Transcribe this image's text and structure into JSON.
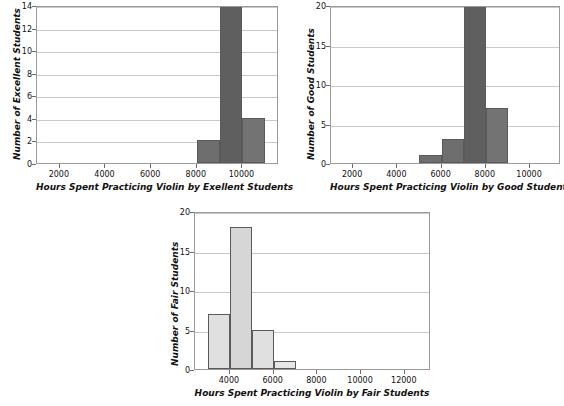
{
  "chart_data": [
    {
      "type": "bar",
      "id": "excellent",
      "title": "",
      "xlabel": "Hours Spent Practicing Violin by Exellent Students",
      "ylabel": "Number of Excellent Students",
      "xticks": [
        2000,
        4000,
        6000,
        8000,
        10000
      ],
      "yticks": [
        0,
        2,
        4,
        6,
        8,
        10,
        12,
        14
      ],
      "xlim": [
        1000,
        11600
      ],
      "ylim": [
        0,
        14
      ],
      "grid": true,
      "bin_width": 1000,
      "bars": [
        {
          "bin_start": 8000,
          "bin_end": 9000,
          "value": 2,
          "color": "#6e6e6e"
        },
        {
          "bin_start": 9000,
          "bin_end": 10000,
          "value": 14,
          "color": "#5f5f5f"
        },
        {
          "bin_start": 10000,
          "bin_end": 11000,
          "value": 4,
          "color": "#737373"
        }
      ]
    },
    {
      "type": "bar",
      "id": "good",
      "title": "",
      "xlabel": "Hours Spent Practicing Violin by Good Students",
      "ylabel": "Number of Good Students",
      "xticks": [
        2000,
        4000,
        6000,
        8000,
        10000
      ],
      "yticks": [
        0,
        5,
        10,
        15,
        20
      ],
      "xlim": [
        1000,
        11400
      ],
      "ylim": [
        0,
        20
      ],
      "grid": true,
      "bin_width": 1000,
      "bars": [
        {
          "bin_start": 5000,
          "bin_end": 6000,
          "value": 1,
          "color": "#6e6e6e"
        },
        {
          "bin_start": 6000,
          "bin_end": 7000,
          "value": 3,
          "color": "#6e6e6e"
        },
        {
          "bin_start": 7000,
          "bin_end": 8000,
          "value": 20,
          "color": "#5f5f5f"
        },
        {
          "bin_start": 8000,
          "bin_end": 9000,
          "value": 7,
          "color": "#737373"
        }
      ]
    },
    {
      "type": "bar",
      "id": "fair",
      "title": "",
      "xlabel": "Hours Spent Practicing Violin by Fair Students",
      "ylabel": "Number of Fair Students",
      "xticks": [
        4000,
        6000,
        8000,
        10000,
        12000
      ],
      "yticks": [
        0,
        5,
        10,
        15,
        20
      ],
      "xlim": [
        2400,
        13200
      ],
      "ylim": [
        0,
        20
      ],
      "grid": true,
      "bin_width": 1000,
      "bars": [
        {
          "bin_start": 3000,
          "bin_end": 4000,
          "value": 7,
          "color": "#e0e0e0"
        },
        {
          "bin_start": 4000,
          "bin_end": 5000,
          "value": 18,
          "color": "#d6d6d6"
        },
        {
          "bin_start": 5000,
          "bin_end": 6000,
          "value": 5,
          "color": "#e0e0e0"
        },
        {
          "bin_start": 6000,
          "bin_end": 7000,
          "value": 1,
          "color": "#e6e6e6"
        }
      ]
    }
  ]
}
